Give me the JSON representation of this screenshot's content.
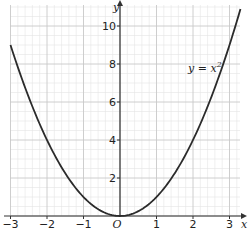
{
  "chart_data": {
    "type": "line",
    "title": "",
    "xlabel": "x",
    "ylabel": "y",
    "xlim": [
      -3,
      3.3
    ],
    "ylim": [
      0,
      11
    ],
    "grid": true,
    "x_ticks": [
      -3,
      -2,
      -1,
      0,
      1,
      2,
      3
    ],
    "x_tick_labels": [
      "−3",
      "−2",
      "−1",
      "O",
      "1",
      "2",
      "3"
    ],
    "y_ticks": [
      2,
      4,
      6,
      8,
      10
    ],
    "y_tick_labels": [
      "2",
      "4",
      "6",
      "8",
      "10"
    ],
    "series": [
      {
        "name": "y = x²",
        "equation": "y = x^2",
        "x": [
          -3,
          -2.5,
          -2,
          -1.5,
          -1,
          -0.5,
          0,
          0.5,
          1,
          1.5,
          2,
          2.5,
          3,
          3.3
        ],
        "y": [
          9,
          6.25,
          4,
          2.25,
          1,
          0.25,
          0,
          0.25,
          1,
          2.25,
          4,
          6.25,
          9,
          10.89
        ]
      }
    ],
    "annotations": [
      {
        "text": "y = x",
        "superscript": "2",
        "x": 2.2,
        "y": 7.9
      }
    ],
    "colors": {
      "curve": "#2b2b2b",
      "axis": "#333333",
      "grid_major": "#c8c8c8",
      "grid_minor": "#e4e4e4"
    }
  },
  "labels": {
    "x_axis": "x",
    "y_axis": "y",
    "origin": "O",
    "curve_main": "y = x",
    "curve_sup": "2"
  }
}
